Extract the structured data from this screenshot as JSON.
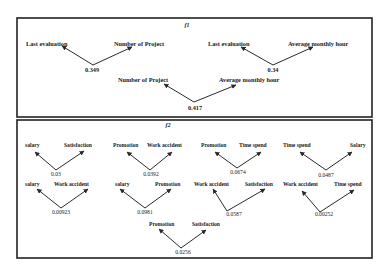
{
  "panels": [
    {
      "title": "f1",
      "nodes": [
        {
          "left": "Last evaluation",
          "right": "Number of Project",
          "value": "0.349"
        },
        {
          "left": "Last evaluation",
          "right": "Average monthly hour",
          "value": "0.34"
        },
        {
          "left": "Number of Project",
          "right": "Average monthly hour",
          "value": "0.417"
        }
      ]
    },
    {
      "title": "f2",
      "nodes": [
        {
          "left": "salary",
          "right": "Satisfaction",
          "value": "0.03"
        },
        {
          "left": "Promotion",
          "right": "Work accident",
          "value": "0.0392"
        },
        {
          "left": "Promotion",
          "right": "Time spend",
          "value": "0.0674"
        },
        {
          "left": "Time spend",
          "right": "Salary",
          "value": "0.0487"
        },
        {
          "left": "salary",
          "right": "Work accident",
          "value": "0.00923"
        },
        {
          "left": "salary",
          "right": "Promotion",
          "value": "0.0981"
        },
        {
          "left": "Work accident",
          "right": "Satisfaction",
          "value": "0.0587"
        },
        {
          "left": "Work accident",
          "right": "Time spend",
          "value": "0.00252"
        },
        {
          "left": "Promotion",
          "right": "Satisfaction",
          "value": "0.0256"
        }
      ]
    }
  ],
  "colors": {
    "line": "#2a2a2a",
    "text": "#1a1a1a",
    "border": "#222222",
    "background": "#ffffff"
  }
}
